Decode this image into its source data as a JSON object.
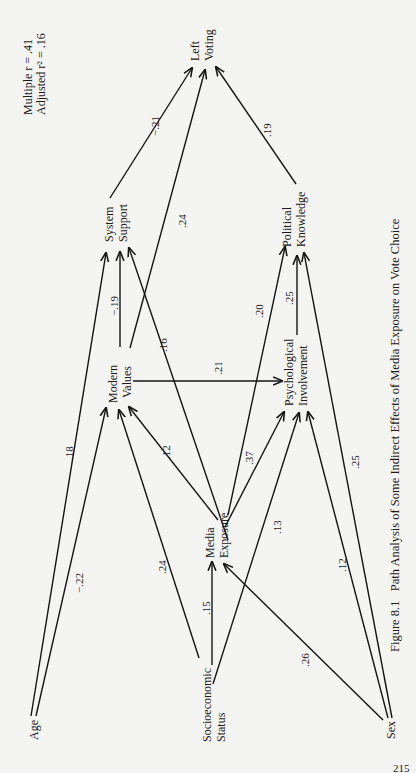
{
  "stats": {
    "multiple_r": "Multiple r = .41",
    "adjusted_r2": "Adjusted r² = .16"
  },
  "nodes": {
    "left_voting": [
      "Left",
      "Voting"
    ],
    "system_support": [
      "System",
      "Support"
    ],
    "political_knowledge": [
      "Political",
      "Knowledge"
    ],
    "modern_values": [
      "Modern",
      "Values"
    ],
    "psychological_involvement": [
      "Psychological",
      "Involvement"
    ],
    "media_exposure": [
      "Media",
      "Exposure"
    ],
    "age": [
      "Age"
    ],
    "socioeconomic_status": [
      "Socioeconomic",
      "Status"
    ],
    "sex": [
      "Sex"
    ]
  },
  "edges": [
    {
      "from": "system_support",
      "to": "left_voting",
      "coef": "−.21"
    },
    {
      "from": "modern_values",
      "to": "left_voting",
      "coef": ".24"
    },
    {
      "from": "political_knowledge",
      "to": "left_voting",
      "coef": ".19"
    },
    {
      "from": "modern_values",
      "to": "system_support",
      "coef": "−.19"
    },
    {
      "from": "media_exposure",
      "to": "system_support",
      "coef": ".16"
    },
    {
      "from": "age",
      "to": "system_support",
      "coef": ".18"
    },
    {
      "from": "age",
      "to": "modern_values",
      "coef": "−.22"
    },
    {
      "from": "socioeconomic_status",
      "to": "modern_values",
      "coef": ".24"
    },
    {
      "from": "media_exposure",
      "to": "modern_values",
      "coef": ".12"
    },
    {
      "from": "modern_values",
      "to": "psychological_involvement",
      "coef": ".21"
    },
    {
      "from": "media_exposure",
      "to": "political_knowledge",
      "coef": ".20"
    },
    {
      "from": "psychological_involvement",
      "to": "political_knowledge",
      "coef": ".25"
    },
    {
      "from": "sex",
      "to": "political_knowledge",
      "coef": ".25"
    },
    {
      "from": "media_exposure",
      "to": "psychological_involvement",
      "coef": ".37"
    },
    {
      "from": "socioeconomic_status",
      "to": "psychological_involvement",
      "coef": ".13"
    },
    {
      "from": "sex",
      "to": "psychological_involvement",
      "coef": ".12"
    },
    {
      "from": "socioeconomic_status",
      "to": "media_exposure",
      "coef": ".15"
    },
    {
      "from": "sex",
      "to": "media_exposure",
      "coef": ".26"
    }
  ],
  "caption": "Figure 8.1   Path Analysis of Some Indirect Effects of Media Exposure on Vote Choice",
  "page_number": "215"
}
